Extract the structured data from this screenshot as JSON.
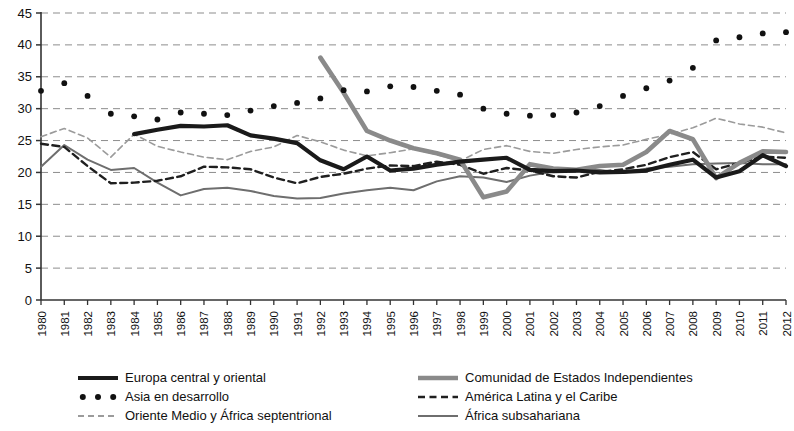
{
  "chart_data": {
    "type": "line",
    "title": "",
    "subtitle": "",
    "xlabel": "",
    "ylabel": "",
    "xlim": [
      1980,
      2012
    ],
    "ylim": [
      0,
      45
    ],
    "ytick_step": 5,
    "yticks": [
      0,
      5,
      10,
      15,
      20,
      25,
      30,
      35,
      40,
      45
    ],
    "grid": true,
    "grid_style": "dashed-horizontal",
    "legend_position": "bottom",
    "legend_columns": 2,
    "x": [
      1980,
      1981,
      1982,
      1983,
      1984,
      1985,
      1986,
      1987,
      1988,
      1989,
      1990,
      1991,
      1992,
      1993,
      1994,
      1995,
      1996,
      1997,
      1998,
      1999,
      2000,
      2001,
      2002,
      2003,
      2004,
      2005,
      2006,
      2007,
      2008,
      2009,
      2010,
      2011,
      2012
    ],
    "categories": [
      "1980",
      "1981",
      "1982",
      "1983",
      "1984",
      "1985",
      "1986",
      "1987",
      "1988",
      "1989",
      "1990",
      "1991",
      "1992",
      "1993",
      "1994",
      "1995",
      "1996",
      "1997",
      "1998",
      "1999",
      "2000",
      "2001",
      "2002",
      "2003",
      "2004",
      "2005",
      "2006",
      "2007",
      "2008",
      "2009",
      "2010",
      "2011",
      "2012"
    ],
    "series": [
      {
        "name": "Europa central y oriental",
        "key": "europa",
        "style": "solid-thick",
        "color": "#1a1a1a",
        "width": 4.2,
        "start_year": 1984,
        "values": [
          null,
          null,
          null,
          null,
          26.0,
          26.7,
          27.3,
          27.2,
          27.4,
          25.8,
          25.3,
          24.6,
          21.9,
          20.5,
          22.5,
          20.3,
          20.6,
          21.2,
          21.7,
          22.0,
          22.3,
          20.4,
          20.2,
          20.3,
          20.0,
          20.1,
          20.3,
          21.2,
          22.0,
          19.2,
          20.2,
          22.7,
          21.0
        ]
      },
      {
        "name": "Asia en desarrollo",
        "key": "asia",
        "style": "dotted-bold",
        "color": "#111111",
        "width": 4.0,
        "start_year": 1980,
        "values": [
          32.8,
          34.0,
          32.0,
          29.2,
          28.8,
          28.3,
          29.4,
          29.2,
          29.0,
          29.7,
          30.4,
          30.9,
          31.6,
          32.9,
          32.7,
          33.5,
          33.4,
          32.8,
          32.2,
          30.0,
          29.2,
          28.9,
          29.0,
          29.4,
          30.4,
          32.0,
          33.2,
          34.4,
          36.4,
          40.7,
          41.2,
          41.8,
          42.0
        ]
      },
      {
        "name": "Oriente Medio y África septentrional",
        "key": "oriente",
        "style": "dashed-light",
        "color": "#9b9b9b",
        "width": 1.6,
        "start_year": 1980,
        "values": [
          25.6,
          26.9,
          25.4,
          22.4,
          26.0,
          24.1,
          23.2,
          22.4,
          22.0,
          23.3,
          24.0,
          25.8,
          24.8,
          23.5,
          22.6,
          23.1,
          23.7,
          22.8,
          21.8,
          23.6,
          24.2,
          23.3,
          23.0,
          23.6,
          24.0,
          24.3,
          25.2,
          26.0,
          27.0,
          28.5,
          27.6,
          27.1,
          26.2
        ]
      },
      {
        "name": "Comunidad de Estados Independientes",
        "key": "cei",
        "style": "solid-thick-gray",
        "color": "#8a8a8a",
        "width": 4.6,
        "start_year": 1992,
        "values": [
          null,
          null,
          null,
          null,
          null,
          null,
          null,
          null,
          null,
          null,
          null,
          null,
          38.0,
          32.5,
          26.5,
          25.0,
          23.8,
          23.0,
          22.0,
          16.1,
          17.0,
          21.3,
          20.6,
          20.4,
          21.0,
          21.2,
          23.2,
          26.5,
          25.2,
          19.1,
          21.5,
          23.3,
          23.2
        ]
      },
      {
        "name": "América Latina y el Caribe",
        "key": "latina",
        "style": "dashed-dark",
        "color": "#1f1f1f",
        "width": 2.4,
        "start_year": 1980,
        "values": [
          24.5,
          24.0,
          21.0,
          18.3,
          18.4,
          18.7,
          19.4,
          20.9,
          20.8,
          20.5,
          19.2,
          18.3,
          19.3,
          19.8,
          20.6,
          21.1,
          21.0,
          21.7,
          21.2,
          19.8,
          20.7,
          20.3,
          19.4,
          19.2,
          20.1,
          20.5,
          21.2,
          22.4,
          23.2,
          20.5,
          21.5,
          22.5,
          22.3
        ]
      },
      {
        "name": "África subsahariana",
        "key": "africa",
        "style": "solid-thin-gray",
        "color": "#6e6e6e",
        "width": 2.0,
        "start_year": 1980,
        "values": [
          20.9,
          24.3,
          22.0,
          20.4,
          20.7,
          18.4,
          16.4,
          17.4,
          17.6,
          17.1,
          16.3,
          15.9,
          16.0,
          16.7,
          17.2,
          17.6,
          17.2,
          18.6,
          19.4,
          19.2,
          18.5,
          19.5,
          20.1,
          20.4,
          20.4,
          19.9,
          20.6,
          20.9,
          21.3,
          21.4,
          21.5,
          21.3,
          21.3
        ]
      }
    ],
    "legend": [
      {
        "label": "Europa central y oriental",
        "key": "europa",
        "column": 0,
        "row": 0
      },
      {
        "label": "Asia en desarrollo",
        "key": "asia",
        "column": 0,
        "row": 1
      },
      {
        "label": "Oriente Medio y África septentrional",
        "key": "oriente",
        "column": 0,
        "row": 2
      },
      {
        "label": "Comunidad de Estados Independientes",
        "key": "cei",
        "column": 1,
        "row": 0
      },
      {
        "label": "América Latina y el Caribe",
        "key": "latina",
        "column": 1,
        "row": 1
      },
      {
        "label": "África subsahariana",
        "key": "africa",
        "column": 1,
        "row": 2
      }
    ]
  }
}
